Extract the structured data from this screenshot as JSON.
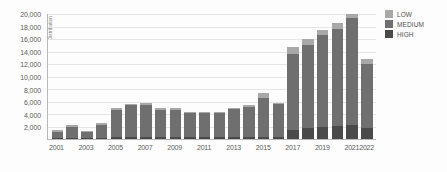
{
  "chart_data": {
    "type": "bar",
    "stacked": true,
    "title": "",
    "xlabel": "",
    "ylabel": "Distribution",
    "ylim": [
      0,
      20000
    ],
    "ytick_step": 2000,
    "grid": true,
    "legend_position": "right",
    "categories": [
      "2001",
      "2002",
      "2003",
      "2004",
      "2005",
      "2006",
      "2007",
      "2008",
      "2009",
      "2010",
      "2011",
      "2012",
      "2013",
      "2014",
      "2015",
      "2016",
      "2017",
      "2018",
      "2019",
      "2020",
      "2021",
      "2022"
    ],
    "xtick_labels": [
      "2001",
      "",
      "2003",
      "",
      "2005",
      "",
      "2007",
      "",
      "2009",
      "",
      "2011",
      "",
      "2013",
      "",
      "2015",
      "",
      "2017",
      "",
      "2019",
      "",
      "2021",
      "2022"
    ],
    "ytick_labels": [
      "0",
      "2,000",
      "4,000",
      "6,000",
      "8,000",
      "10,000",
      "12,000",
      "14,000",
      "16,000",
      "18,000",
      "20,000"
    ],
    "ytick_values": [
      0,
      2000,
      4000,
      6000,
      8000,
      10000,
      12000,
      14000,
      16000,
      18000,
      20000
    ],
    "series": [
      {
        "name": "HIGH",
        "color": "#4a4a4a",
        "values": [
          120,
          160,
          130,
          200,
          260,
          300,
          320,
          300,
          280,
          260,
          250,
          270,
          300,
          320,
          360,
          340,
          1500,
          1700,
          1900,
          2100,
          2300,
          1700
        ]
      },
      {
        "name": "MEDIUM",
        "color": "#6f6f6f",
        "values": [
          1080,
          1740,
          1020,
          2100,
          4440,
          5100,
          5180,
          4400,
          4420,
          3940,
          3850,
          3930,
          4500,
          4880,
          6140,
          5260,
          12100,
          13400,
          14700,
          15500,
          17100,
          10300
        ]
      },
      {
        "name": "LOW",
        "color": "#a8a8a8",
        "values": [
          200,
          300,
          150,
          300,
          300,
          200,
          300,
          200,
          200,
          200,
          200,
          200,
          200,
          200,
          900,
          200,
          1100,
          900,
          900,
          900,
          600,
          800
        ]
      }
    ],
    "totals": [
      1400,
      2200,
      1300,
      2600,
      5000,
      5600,
      5800,
      4900,
      4900,
      4400,
      4300,
      4400,
      5000,
      5400,
      7400,
      5800,
      14700,
      16000,
      17500,
      18500,
      20000,
      12800
    ]
  },
  "legend": {
    "items": [
      {
        "label": "LOW",
        "color": "#a8a8a8"
      },
      {
        "label": "MEDIUM",
        "color": "#6f6f6f"
      },
      {
        "label": "HIGH",
        "color": "#4a4a4a"
      }
    ]
  }
}
